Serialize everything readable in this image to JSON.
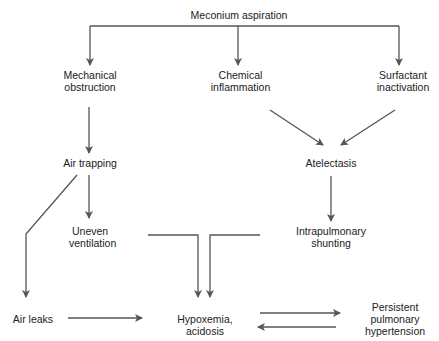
{
  "diagram": {
    "nodes": {
      "meconium": "Meconium aspiration",
      "mech1": "Mechanical",
      "mech2": "obstruction",
      "chem1": "Chemical",
      "chem2": "inflammation",
      "surf1": "Surfactant",
      "surf2": "inactivation",
      "airtrap": "Air trapping",
      "atelect": "Atelectasis",
      "uneven1": "Uneven",
      "uneven2": "ventilation",
      "intra1": "Intrapulmonary",
      "intra2": "shunting",
      "airleaks": "Air leaks",
      "hypox1": "Hypoxemia,",
      "hypox2": "acidosis",
      "pphn1": "Persistent",
      "pphn2": "pulmonary",
      "pphn3": "hypertension"
    },
    "edges": [
      [
        "Meconium aspiration",
        "Mechanical obstruction"
      ],
      [
        "Meconium aspiration",
        "Chemical inflammation"
      ],
      [
        "Meconium aspiration",
        "Surfactant inactivation"
      ],
      [
        "Mechanical obstruction",
        "Air trapping"
      ],
      [
        "Chemical inflammation",
        "Atelectasis"
      ],
      [
        "Surfactant inactivation",
        "Atelectasis"
      ],
      [
        "Air trapping",
        "Uneven ventilation"
      ],
      [
        "Air trapping",
        "Air leaks"
      ],
      [
        "Atelectasis",
        "Intrapulmonary shunting"
      ],
      [
        "Uneven ventilation",
        "Hypoxemia, acidosis"
      ],
      [
        "Intrapulmonary shunting",
        "Hypoxemia, acidosis"
      ],
      [
        "Air leaks",
        "Hypoxemia, acidosis"
      ],
      [
        "Hypoxemia, acidosis",
        "Persistent pulmonary hypertension"
      ],
      [
        "Persistent pulmonary hypertension",
        "Hypoxemia, acidosis"
      ]
    ],
    "line_color": "#555555"
  }
}
